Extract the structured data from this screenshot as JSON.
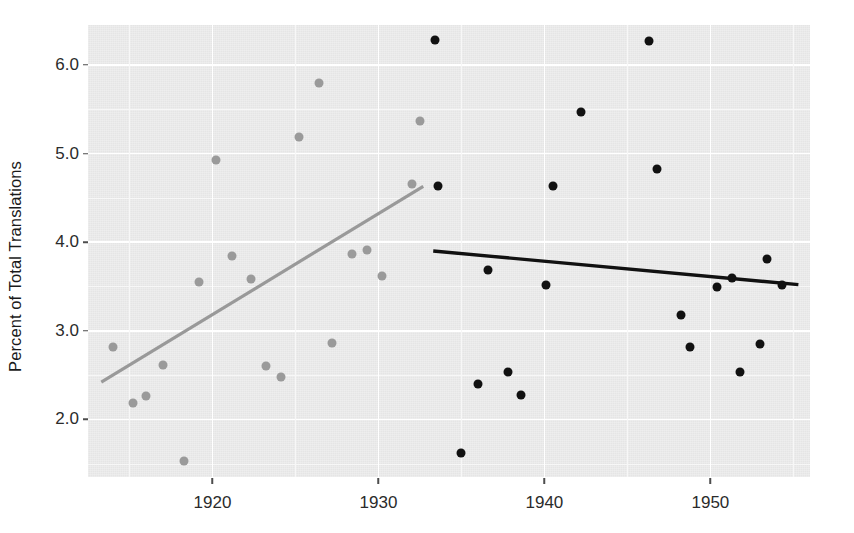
{
  "chart_data": {
    "type": "scatter",
    "title": "",
    "xlabel": "",
    "ylabel": "Percent of Total Translations",
    "xlim": [
      1912.5,
      1956.0
    ],
    "ylim": [
      1.35,
      6.45
    ],
    "x_ticks": [
      1920,
      1930,
      1940,
      1950
    ],
    "y_ticks": [
      2.0,
      3.0,
      4.0,
      5.0,
      6.0
    ],
    "y_tick_labels": [
      "2.0",
      "3.0",
      "4.0",
      "5.0",
      "6.0"
    ],
    "x_tick_labels": [
      "1920",
      "1930",
      "1940",
      "1950"
    ],
    "grid": true,
    "legend": "none",
    "panel_background": "#ebebeb",
    "grid_major_color": "#ffffff",
    "series": [
      {
        "name": "early-period",
        "color": "#9a9a9a",
        "marker": "circle",
        "points": [
          {
            "x": 1914.0,
            "y": 2.82
          },
          {
            "x": 1915.2,
            "y": 2.19
          },
          {
            "x": 1916.0,
            "y": 2.26
          },
          {
            "x": 1917.0,
            "y": 2.61
          },
          {
            "x": 1918.3,
            "y": 1.53
          },
          {
            "x": 1919.2,
            "y": 3.55
          },
          {
            "x": 1920.2,
            "y": 4.93
          },
          {
            "x": 1921.2,
            "y": 3.84
          },
          {
            "x": 1922.3,
            "y": 3.58
          },
          {
            "x": 1923.2,
            "y": 2.6
          },
          {
            "x": 1924.1,
            "y": 2.48
          },
          {
            "x": 1925.2,
            "y": 5.19
          },
          {
            "x": 1926.4,
            "y": 5.79
          },
          {
            "x": 1927.2,
            "y": 2.86
          },
          {
            "x": 1928.4,
            "y": 3.87
          },
          {
            "x": 1929.3,
            "y": 3.91
          },
          {
            "x": 1930.2,
            "y": 3.62
          },
          {
            "x": 1932.0,
            "y": 4.66
          },
          {
            "x": 1932.5,
            "y": 5.37
          }
        ],
        "trendline": {
          "x0": 1913.3,
          "y0": 2.42,
          "x1": 1932.7,
          "y1": 4.63,
          "color": "#999999",
          "width": 3.2
        }
      },
      {
        "name": "late-period",
        "color": "#111111",
        "marker": "circle",
        "points": [
          {
            "x": 1933.4,
            "y": 6.28
          },
          {
            "x": 1933.6,
            "y": 4.63
          },
          {
            "x": 1935.0,
            "y": 1.62
          },
          {
            "x": 1936.0,
            "y": 2.4
          },
          {
            "x": 1936.6,
            "y": 3.68
          },
          {
            "x": 1937.8,
            "y": 2.53
          },
          {
            "x": 1938.6,
            "y": 2.27
          },
          {
            "x": 1940.1,
            "y": 3.52
          },
          {
            "x": 1940.5,
            "y": 4.63
          },
          {
            "x": 1942.2,
            "y": 5.47
          },
          {
            "x": 1946.3,
            "y": 6.27
          },
          {
            "x": 1946.8,
            "y": 4.82
          },
          {
            "x": 1948.2,
            "y": 3.18
          },
          {
            "x": 1948.8,
            "y": 2.82
          },
          {
            "x": 1950.4,
            "y": 3.49
          },
          {
            "x": 1951.3,
            "y": 3.6
          },
          {
            "x": 1951.8,
            "y": 2.54
          },
          {
            "x": 1953.0,
            "y": 2.85
          },
          {
            "x": 1953.4,
            "y": 3.81
          },
          {
            "x": 1954.3,
            "y": 3.52
          }
        ],
        "trendline": {
          "x0": 1933.3,
          "y0": 3.9,
          "x1": 1955.3,
          "y1": 3.52,
          "color": "#111111",
          "width": 3.4
        }
      }
    ]
  }
}
